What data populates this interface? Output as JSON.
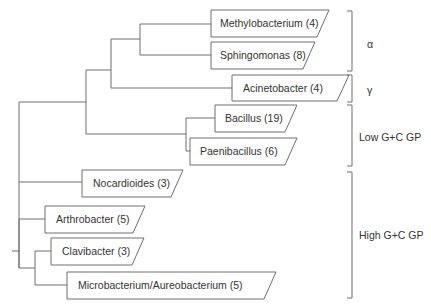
{
  "diagram": {
    "type": "phylogenetic-tree",
    "taxa": [
      {
        "id": "methylobacterium",
        "label": "Methylobacterium (4)"
      },
      {
        "id": "sphingomonas",
        "label": "Sphingomonas (8)"
      },
      {
        "id": "acinetobacter",
        "label": "Acinetobacter (4)"
      },
      {
        "id": "bacillus",
        "label": "Bacillus (19)"
      },
      {
        "id": "paenibacillus",
        "label": "Paenibacillus (6)"
      },
      {
        "id": "nocardioides",
        "label": "Nocardioides (3)"
      },
      {
        "id": "arthrobacter",
        "label": "Arthrobacter (5)"
      },
      {
        "id": "clavibacter",
        "label": "Clavibacter (3)"
      },
      {
        "id": "microbacterium",
        "label": "Microbacterium/Aureobacterium (5)"
      }
    ],
    "groups": [
      {
        "id": "alpha",
        "label": "α"
      },
      {
        "id": "gamma",
        "label": "γ"
      },
      {
        "id": "low-gc",
        "label": "Low G+C GP"
      },
      {
        "id": "high-gc",
        "label": "High G+C GP"
      }
    ],
    "colors": {
      "line": "#6e6e6e",
      "text": "#333333",
      "background": "#ffffff"
    }
  }
}
